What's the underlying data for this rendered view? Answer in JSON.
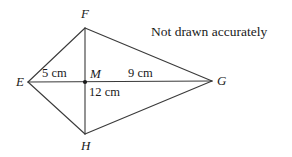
{
  "figure": {
    "note": "Not drawn accurately",
    "background_color": "#ffffff",
    "line_color": "#3a3a3a",
    "text_color": "#1a1a1a"
  },
  "vertices": {
    "E": {
      "label": "E",
      "x": 28,
      "y": 82
    },
    "F": {
      "label": "F",
      "x": 85,
      "y": 28
    },
    "G": {
      "label": "G",
      "x": 212,
      "y": 81
    },
    "H": {
      "label": "H",
      "x": 85,
      "y": 134
    },
    "M": {
      "label": "M",
      "x": 85,
      "y": 82
    }
  },
  "measurements": {
    "EM": {
      "label": "5 cm",
      "value": 5,
      "unit": "cm",
      "segment": "EM"
    },
    "MG": {
      "label": "9 cm",
      "value": 9,
      "unit": "cm",
      "segment": "MG"
    },
    "MH": {
      "label": "12 cm",
      "value": 12,
      "unit": "cm",
      "segment": "MH"
    }
  },
  "edges": [
    {
      "name": "EF",
      "from": "E",
      "to": "F"
    },
    {
      "name": "FG",
      "from": "F",
      "to": "G"
    },
    {
      "name": "GH",
      "from": "G",
      "to": "H"
    },
    {
      "name": "HE",
      "from": "H",
      "to": "E"
    },
    {
      "name": "EG",
      "from": "E",
      "to": "G"
    },
    {
      "name": "FH",
      "from": "F",
      "to": "H"
    }
  ]
}
